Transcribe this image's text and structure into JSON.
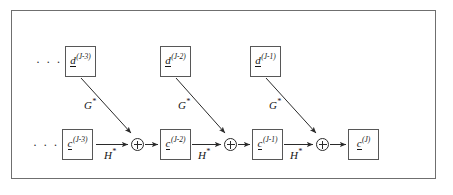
{
  "figure": {
    "kind": "signal-flow-diagram",
    "frame_color": "#6f6f6f",
    "box_border_color": "#575757",
    "ink_color": "#141414",
    "background": "#ffffff"
  },
  "ellipses": {
    "detail_row": "· · ·",
    "approx_row": "· · ·"
  },
  "detail_nodes": [
    {
      "symbol": "d",
      "superscript": "(J-3)",
      "x": 65,
      "y": 46
    },
    {
      "symbol": "d",
      "superscript": "(J-2)",
      "x": 160,
      "y": 46
    },
    {
      "symbol": "d",
      "superscript": "(J-1)",
      "x": 250,
      "y": 46
    }
  ],
  "approx_nodes": [
    {
      "symbol": "c",
      "superscript": "(J-3)",
      "x": 62,
      "y": 129
    },
    {
      "symbol": "c",
      "superscript": "(J-2)",
      "x": 160,
      "y": 129
    },
    {
      "symbol": "c",
      "superscript": "(J-1)",
      "x": 252,
      "y": 129
    },
    {
      "symbol": "c",
      "superscript": "(J)",
      "x": 348,
      "y": 129
    }
  ],
  "operators": {
    "synthesis_detail": {
      "symbol": "G",
      "superscript": "*"
    },
    "synthesis_approx": {
      "symbol": "H",
      "superscript": "*"
    },
    "combine": "circle-plus"
  },
  "diagonal_labels": [
    {
      "text": "G",
      "sup": "*",
      "x": 84,
      "y": 100
    },
    {
      "text": "G",
      "sup": "*",
      "x": 178,
      "y": 100
    },
    {
      "text": "G",
      "sup": "*",
      "x": 269,
      "y": 100
    }
  ],
  "horizontal_labels": [
    {
      "text": "H",
      "sup": "*",
      "x": 104,
      "y": 150
    },
    {
      "text": "H",
      "sup": "*",
      "x": 198,
      "y": 150
    },
    {
      "text": "H",
      "sup": "*",
      "x": 290,
      "y": 150
    }
  ],
  "plus_nodes": [
    {
      "x": 131,
      "y": 138
    },
    {
      "x": 224,
      "y": 138
    },
    {
      "x": 316,
      "y": 138
    }
  ]
}
